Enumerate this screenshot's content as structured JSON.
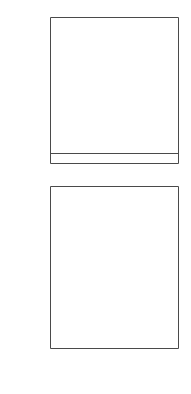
{
  "figure": {
    "background": "#ffffff",
    "ink": "#3a3a3a",
    "text_color": "#1a1a1a"
  },
  "chart_data": [
    {
      "type": "scatter",
      "panel": "top",
      "title": "",
      "xlabel": "",
      "ylabel": "σ_L / σ_T",
      "ylabel_display": "σ",
      "ylabel_sub1": "L",
      "ylabel_mid": "/σ",
      "ylabel_sub2": "T",
      "xlim": [
        0,
        1
      ],
      "ylim": [
        0,
        1.08
      ],
      "xticks": [
        0,
        0.2,
        0.4,
        0.6,
        0.8,
        1
      ],
      "xticklabels": [
        "",
        "",
        "",
        "",
        "",
        ""
      ],
      "yticks": [
        0,
        0.2,
        0.4,
        0.6,
        0.8,
        1.0
      ],
      "yticklabels": [
        "0",
        "0·2",
        "0·4",
        "0·6",
        "0·8",
        "1·0"
      ],
      "grid": false,
      "legend": null,
      "frame": "box",
      "marker": "cross-with-errorbars",
      "points": [
        {
          "x": 0.035,
          "y": 1.0,
          "xerr": 0.035,
          "yerr": 0.045
        },
        {
          "x": 0.105,
          "y": 0.7,
          "xerr": 0.035,
          "yerr": 0.055
        },
        {
          "x": 0.205,
          "y": 0.365,
          "xerr": 0.035,
          "yerr": 0.055
        },
        {
          "x": 0.295,
          "y": 0.195,
          "xerr": 0.045,
          "yerr": 0.045
        },
        {
          "x": 0.415,
          "y": 0.205,
          "xerr": 0.055,
          "yerr": 0.055
        },
        {
          "x": 0.605,
          "y": 0.025,
          "xerr": 0.075,
          "yerr": 0.085
        },
        {
          "x": 0.735,
          "y": 0.025,
          "xerr": 0.055,
          "yerr": 0.035
        },
        {
          "x": 0.855,
          "y": 0.02,
          "xerr": 0.075,
          "yerr": 0.095
        }
      ]
    },
    {
      "type": "scatter",
      "panel": "bottom",
      "title": "",
      "xlabel": "z",
      "ylabel": "a",
      "xlim": [
        0,
        1
      ],
      "ylim": [
        0,
        1.3
      ],
      "xticks": [
        0,
        0.2,
        0.4,
        0.6,
        0.8,
        1
      ],
      "xticklabels": [
        "0",
        "0·2",
        "0·4",
        "0·6",
        "0·8",
        "1"
      ],
      "yticks": [
        0.2,
        0.4,
        0.6,
        0.8,
        1.0
      ],
      "yticklabels": [
        "0·2",
        "0·4",
        "0·6",
        "0·8",
        "1·0"
      ],
      "grid": false,
      "legend": null,
      "frame": "box",
      "marker": "cross-with-errorbars",
      "points": [
        {
          "x": 0.145,
          "y": 0.18,
          "xerr": 0.05,
          "yerr": 0.045
        },
        {
          "x": 0.24,
          "y": 0.485,
          "xerr": 0.03,
          "yerr": 0.055
        },
        {
          "x": 0.34,
          "y": 0.7,
          "xerr": 0.04,
          "yerr": 0.085
        },
        {
          "x": 0.45,
          "y": 0.66,
          "xerr": 0.065,
          "yerr": 0.11
        },
        {
          "x": 0.7,
          "y": 1.01,
          "xerr": 0.1,
          "yerr": 0.205
        },
        {
          "x": 0.87,
          "y": 1.01,
          "xerr": 0.105,
          "yerr": 0.255
        }
      ]
    }
  ]
}
